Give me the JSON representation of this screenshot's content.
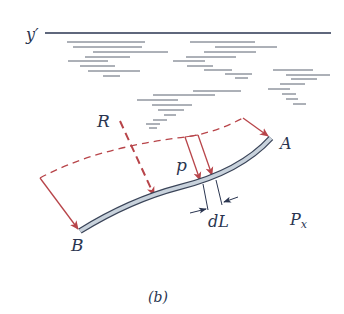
{
  "figure": {
    "caption": "(b)",
    "colors": {
      "ink": "#2a3550",
      "force": "#b8454a",
      "beam_fill": "#c8d2dc",
      "beam_edge": "#3a4458",
      "water_lines": "#5a6270"
    },
    "labels": {
      "surface": "y′",
      "resultant": "R",
      "pressure": "p",
      "end_a": "A",
      "end_b": "B",
      "element": "dL",
      "component_base": "P",
      "component_sub": "x"
    }
  }
}
